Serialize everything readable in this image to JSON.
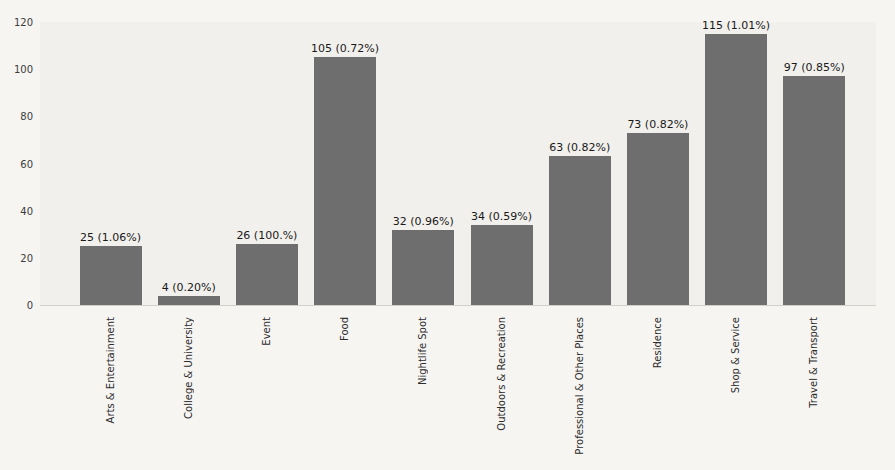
{
  "figure": {
    "background": "#f6f5f2",
    "plot_background": "#f1f0ec"
  },
  "chart_data": {
    "type": "bar",
    "title": "",
    "xlabel": "",
    "ylabel": "",
    "categories": [
      "Arts & Entertainment",
      "College & University",
      "Event",
      "Food",
      "Nightlife Spot",
      "Outdoors & Recreation",
      "Professional & Other Places",
      "Residence",
      "Shop & Service",
      "Travel & Transport"
    ],
    "values": [
      25,
      4,
      26,
      105,
      32,
      34,
      63,
      73,
      115,
      97
    ],
    "bar_labels": [
      "25 (1.06%)",
      "4 (0.20%)",
      "26 (100.%)",
      "105 (0.72%)",
      "32 (0.96%)",
      "34 (0.59%)",
      "63 (0.82%)",
      "73 (0.82%)",
      "115 (1.01%)",
      "97 (0.85%)"
    ],
    "ylim": [
      0,
      120
    ],
    "yticks": [
      0,
      20,
      40,
      60,
      80,
      100,
      120
    ],
    "grid": false,
    "legend": null,
    "bar_color": "#6e6e6e",
    "value_label_color": "#1a1a1a",
    "tick_label_color": "#3c3c3c"
  }
}
